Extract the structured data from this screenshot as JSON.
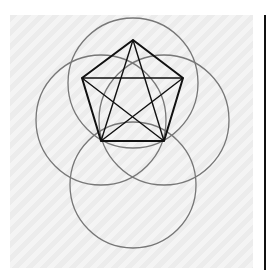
{
  "figure": {
    "colors": {
      "background": "#ffffff",
      "panel": "#efefef",
      "circle_stroke": "#777777",
      "pentagon_stroke": "#111111",
      "edge_bar": "#111111"
    },
    "circles": [
      {
        "name": "top-circle",
        "cx": 133,
        "cy": 83,
        "r": 65
      },
      {
        "name": "left-circle",
        "cx": 101,
        "cy": 120,
        "r": 65
      },
      {
        "name": "right-circle",
        "cx": 164,
        "cy": 120,
        "r": 65
      },
      {
        "name": "bottom-circle",
        "cx": 133,
        "cy": 185,
        "r": 63
      }
    ],
    "pentagon_vertices": [
      {
        "name": "top",
        "x": 133,
        "y": 40
      },
      {
        "name": "upper-right",
        "x": 183,
        "y": 78
      },
      {
        "name": "lower-right",
        "x": 164,
        "y": 141
      },
      {
        "name": "lower-left",
        "x": 101,
        "y": 141
      },
      {
        "name": "upper-left",
        "x": 82,
        "y": 78
      }
    ]
  }
}
